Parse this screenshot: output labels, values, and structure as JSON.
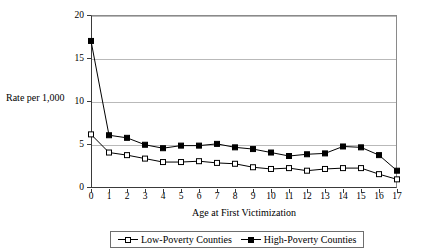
{
  "chart_data": {
    "type": "line",
    "title": "",
    "xlabel": "Age at First Victimization",
    "ylabel": "Rate per 1,000",
    "x": [
      0,
      1,
      2,
      3,
      4,
      5,
      6,
      7,
      8,
      9,
      10,
      11,
      12,
      13,
      14,
      15,
      16,
      17
    ],
    "categories": [
      "0",
      "1",
      "2",
      "3",
      "4",
      "5",
      "6",
      "7",
      "8",
      "9",
      "10",
      "11",
      "12",
      "13",
      "14",
      "15",
      "16",
      "17"
    ],
    "xlim": [
      0,
      17
    ],
    "ylim": [
      0,
      20
    ],
    "yticks": [
      0,
      5,
      10,
      15,
      20
    ],
    "ytick_labels": [
      "0",
      "5",
      "10",
      "15",
      "20"
    ],
    "xticks": [
      0,
      1,
      2,
      3,
      4,
      5,
      6,
      7,
      8,
      9,
      10,
      11,
      12,
      13,
      14,
      15,
      16,
      17
    ],
    "grid": "horizontal",
    "legend_position": "bottom",
    "series": [
      {
        "name": "Low-Poverty Counties",
        "marker": "open-square",
        "color": "#000000",
        "values": [
          6.2,
          4.1,
          3.8,
          3.4,
          3.0,
          3.0,
          3.1,
          2.9,
          2.8,
          2.4,
          2.2,
          2.3,
          2.0,
          2.2,
          2.3,
          2.3,
          1.6,
          1.0
        ]
      },
      {
        "name": "High-Poverty Counties",
        "marker": "filled-square",
        "color": "#000000",
        "values": [
          17.0,
          6.1,
          5.8,
          5.0,
          4.6,
          4.9,
          4.9,
          5.1,
          4.7,
          4.5,
          4.1,
          3.7,
          3.9,
          4.0,
          4.8,
          4.7,
          3.8,
          2.0
        ]
      }
    ]
  },
  "legend": {
    "items": [
      {
        "label": "Low-Poverty Counties"
      },
      {
        "label": "High-Poverty Counties"
      }
    ]
  }
}
